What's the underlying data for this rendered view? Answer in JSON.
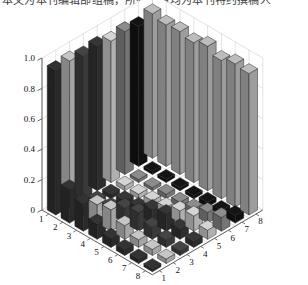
{
  "top_text_fragment": "本文为本刊编辑部组稿，所有作者均为本刊特约撰稿人",
  "chart_data": {
    "type": "bar",
    "subtype": "bar3-matlab",
    "title": "",
    "xlabel": "",
    "ylabel": "",
    "zlabel": "",
    "grid": true,
    "legend": null,
    "z_ticklabels": [
      "1.0",
      "0.8",
      "0.6",
      "0.4",
      "0.2",
      "0"
    ],
    "z_tickvalues": [
      1.0,
      0.8,
      0.6,
      0.4,
      0.2,
      0
    ],
    "zlim": [
      0,
      1.0
    ],
    "left_axis_ticklabels": [
      "1",
      "2",
      "3",
      "4",
      "5",
      "6",
      "7",
      "8"
    ],
    "right_axis_ticklabels": [
      "1",
      "2",
      "3",
      "4",
      "5",
      "6",
      "7",
      "8"
    ],
    "rows": 8,
    "cols": 8,
    "row_colors": [
      "#2b2b2b",
      "#a8a8a8",
      "#3a3a3a",
      "#2e2e2e",
      "#b4b4b4",
      "#777777",
      "#111111",
      "#a0a0a0"
    ],
    "values": [
      [
        0.95,
        0.96,
        0.94,
        0.95,
        0.93,
        0.94,
        0.92,
        0.95
      ],
      [
        0.22,
        0.05,
        0.04,
        0.03,
        0.03,
        0.02,
        0.02,
        0.93
      ],
      [
        0.18,
        0.12,
        0.05,
        0.04,
        0.03,
        0.02,
        0.02,
        0.94
      ],
      [
        0.1,
        0.14,
        0.1,
        0.05,
        0.04,
        0.03,
        0.02,
        0.92
      ],
      [
        0.06,
        0.09,
        0.12,
        0.09,
        0.05,
        0.03,
        0.02,
        0.95
      ],
      [
        0.04,
        0.05,
        0.08,
        0.11,
        0.08,
        0.04,
        0.03,
        0.91
      ],
      [
        0.03,
        0.04,
        0.05,
        0.07,
        0.1,
        0.07,
        0.03,
        0.94
      ],
      [
        0.02,
        0.03,
        0.03,
        0.04,
        0.06,
        0.09,
        0.05,
        0.93
      ]
    ]
  }
}
